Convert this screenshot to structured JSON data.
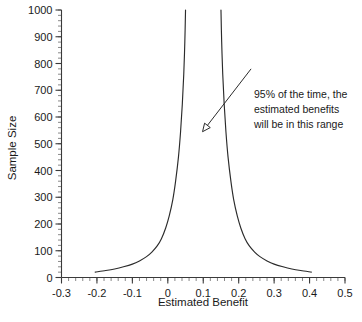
{
  "chart_data": {
    "type": "line",
    "title": "",
    "xlabel": "Estimated Benefit",
    "ylabel": "Sample Size",
    "xlim": [
      -0.3,
      0.5
    ],
    "ylim": [
      0,
      1000
    ],
    "grid": false,
    "legend": "none",
    "x_ticks": [
      "-0.3",
      "-0.2",
      "-0.1",
      "0",
      "0.1",
      "0.2",
      "0.3",
      "0.4",
      "0.5"
    ],
    "x_tick_values": [
      -0.3,
      -0.2,
      -0.1,
      0,
      0.1,
      0.2,
      0.3,
      0.4,
      0.5
    ],
    "y_ticks": [
      "0",
      "100",
      "200",
      "300",
      "400",
      "500",
      "600",
      "700",
      "800",
      "900",
      "1000"
    ],
    "y_tick_values": [
      0,
      100,
      200,
      300,
      400,
      500,
      600,
      700,
      800,
      900,
      1000
    ],
    "x_minor_tick_step": 0.02,
    "y_minor_tick_step": 20,
    "series": [
      {
        "name": "lower confidence limit",
        "points": [
          [
            -0.205,
            20
          ],
          [
            -0.175,
            26
          ],
          [
            -0.15,
            32
          ],
          [
            -0.125,
            40
          ],
          [
            -0.1,
            50
          ],
          [
            -0.08,
            62
          ],
          [
            -0.06,
            78
          ],
          [
            -0.045,
            95
          ],
          [
            -0.03,
            118
          ],
          [
            -0.018,
            145
          ],
          [
            -0.006,
            185
          ],
          [
            0.004,
            230
          ],
          [
            0.014,
            290
          ],
          [
            0.022,
            360
          ],
          [
            0.03,
            450
          ],
          [
            0.036,
            545
          ],
          [
            0.041,
            650
          ],
          [
            0.045,
            760
          ],
          [
            0.048,
            880
          ],
          [
            0.05,
            1000
          ]
        ]
      },
      {
        "name": "upper confidence limit",
        "points": [
          [
            0.15,
            1000
          ],
          [
            0.152,
            880
          ],
          [
            0.155,
            760
          ],
          [
            0.159,
            650
          ],
          [
            0.164,
            545
          ],
          [
            0.17,
            450
          ],
          [
            0.178,
            360
          ],
          [
            0.186,
            290
          ],
          [
            0.196,
            230
          ],
          [
            0.206,
            185
          ],
          [
            0.218,
            145
          ],
          [
            0.23,
            118
          ],
          [
            0.245,
            95
          ],
          [
            0.26,
            78
          ],
          [
            0.28,
            62
          ],
          [
            0.3,
            50
          ],
          [
            0.325,
            40
          ],
          [
            0.35,
            32
          ],
          [
            0.375,
            26
          ],
          [
            0.405,
            20
          ]
        ]
      }
    ],
    "annotations": [
      {
        "name": "confidence-range-note",
        "lines": [
          "95% of the time, the",
          "estimated benefits",
          "will be in this range"
        ],
        "arrow_from": [
          0.235,
          780
        ],
        "arrow_to": [
          0.098,
          545
        ]
      }
    ],
    "colors": {
      "curve": "#2b2b2b",
      "axis": "#3a3a3a",
      "text": "#1a1a1a",
      "background": "#ffffff"
    }
  }
}
